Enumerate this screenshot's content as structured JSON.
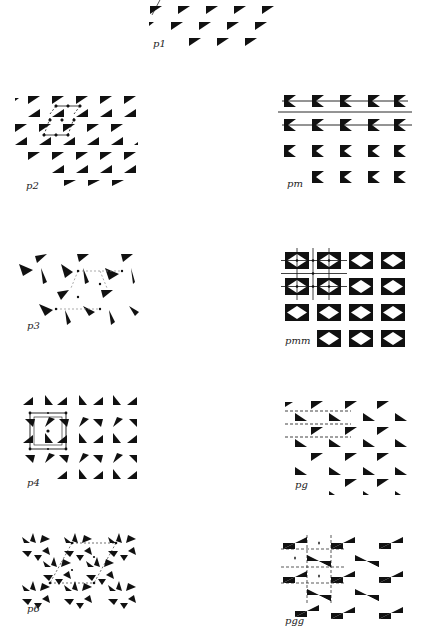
{
  "figure": {
    "ink_color": "#111111",
    "background": "#ffffff",
    "panels": [
      {
        "id": "p1",
        "label": "p1",
        "x": 150,
        "y": 0,
        "label_x": 153,
        "label_y": 36
      },
      {
        "id": "p2",
        "label": "p2",
        "x": 20,
        "y": 90,
        "label_x": 26,
        "label_y": 180
      },
      {
        "id": "pm",
        "label": "pm",
        "x": 282,
        "y": 93,
        "label_x": 287,
        "label_y": 178
      },
      {
        "id": "p3",
        "label": "p3",
        "x": 25,
        "y": 250,
        "label_x": 27,
        "label_y": 320
      },
      {
        "id": "pmm",
        "label": "pmm",
        "x": 285,
        "y": 252,
        "label_x": 285,
        "label_y": 333
      },
      {
        "id": "p4",
        "label": "p4",
        "x": 23,
        "y": 395,
        "label_x": 27,
        "label_y": 477
      },
      {
        "id": "pg",
        "label": "pg",
        "x": 285,
        "y": 395,
        "label_x": 295,
        "label_y": 477
      },
      {
        "id": "p6",
        "label": "p6",
        "x": 22,
        "y": 533,
        "label_x": 27,
        "label_y": 603
      },
      {
        "id": "pgg",
        "label": "pgg",
        "x": 285,
        "y": 533,
        "label_x": 285,
        "label_y": 615
      }
    ]
  }
}
